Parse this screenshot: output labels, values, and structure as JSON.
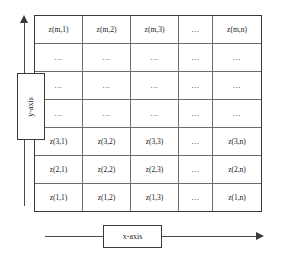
{
  "diagram": {
    "colors": {
      "outer_border": "#3a3a3a",
      "inner_border": "#6d6d6d",
      "axis_line": "#4a4a4a",
      "text": "#1a1a1a",
      "background": "#ffffff"
    }
  },
  "axes": {
    "x_label": "x-axis",
    "y_label": "y-axis",
    "x_direction": "right",
    "y_direction": "up"
  },
  "grid": {
    "rows": 7,
    "columns": 5,
    "cells": [
      [
        "z(m,1)",
        "z(m,2)",
        "z(m,3)",
        "...",
        "z(m,n)"
      ],
      [
        "...",
        "...",
        "...",
        "...",
        "..."
      ],
      [
        "...",
        "...",
        "...",
        "...",
        "..."
      ],
      [
        "...",
        "...",
        "...",
        "...",
        "..."
      ],
      [
        "z(3,1)",
        "z(3,2)",
        "z(3,3)",
        "...",
        "z(3,n)"
      ],
      [
        "z(2,1)",
        "z(2,2)",
        "z(2,3)",
        "...",
        "z(2,n)"
      ],
      [
        "z(1,1)",
        "z(1,2)",
        "z(1,3)",
        "...",
        "z(1,n)"
      ]
    ]
  }
}
